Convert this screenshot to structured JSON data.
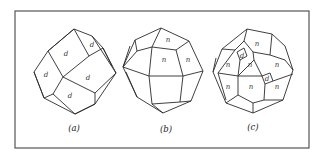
{
  "figure": {
    "panels": [
      {
        "id": "a",
        "caption": "(a)",
        "face_labels": [
          "d",
          "d",
          "d",
          "d",
          "d"
        ]
      },
      {
        "id": "b",
        "caption": "(b)",
        "face_labels": [
          "n",
          "n",
          "n"
        ]
      },
      {
        "id": "c",
        "caption": "(c)",
        "face_labels": [
          "n",
          "d",
          "n",
          "n",
          "n",
          "d",
          "n",
          "n",
          "n"
        ]
      }
    ]
  }
}
